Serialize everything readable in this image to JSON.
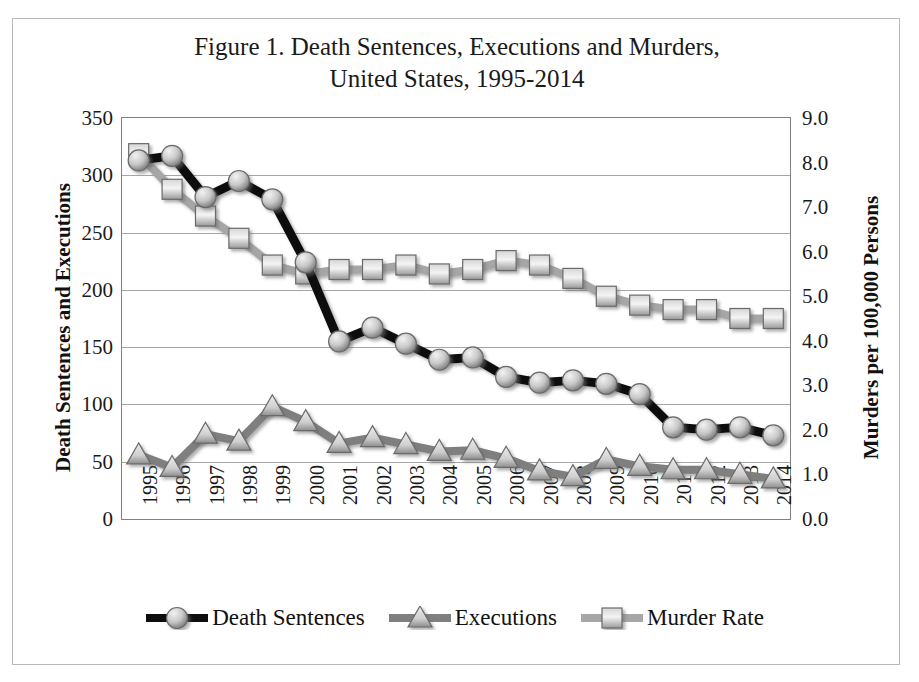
{
  "figure": {
    "title_line1": "Figure 1.  Death Sentences, Executions and Murders,",
    "title_line2": "United States, 1995-2014",
    "y_left_title": "Death Sentences and Executions",
    "y_right_title": "Murders per 100,000 Persons"
  },
  "legend": {
    "items": [
      {
        "label": "Death Sentences",
        "marker": "circle-marker",
        "color": "#0d0d0d"
      },
      {
        "label": "Executions",
        "marker": "triangle-marker",
        "color": "#7f7f7f"
      },
      {
        "label": "Murder Rate",
        "marker": "square-marker",
        "color": "#a6a6a6"
      }
    ]
  },
  "axes": {
    "left_ticks": [
      "0",
      "50",
      "100",
      "150",
      "200",
      "250",
      "300",
      "350"
    ],
    "right_ticks": [
      "0.0",
      "1.0",
      "2.0",
      "3.0",
      "4.0",
      "5.0",
      "6.0",
      "7.0",
      "8.0",
      "9.0"
    ],
    "x_ticks": [
      "1995",
      "1996",
      "1997",
      "1998",
      "1999",
      "2000",
      "2001",
      "2002",
      "2003",
      "2004",
      "2005",
      "2006",
      "2007",
      "2008",
      "2009",
      "2010",
      "2011",
      "2012",
      "2013",
      "2014"
    ]
  },
  "chart_data": {
    "type": "line",
    "title": "Figure 1.  Death Sentences, Executions and Murders, United States, 1995-2014",
    "xlabel": "",
    "ylabel": "Death Sentences and Executions",
    "y2label": "Murders per 100,000 Persons",
    "ylim": [
      0,
      350
    ],
    "y2lim": [
      0.0,
      9.0
    ],
    "grid": true,
    "legend_position": "bottom",
    "categories": [
      "1995",
      "1996",
      "1997",
      "1998",
      "1999",
      "2000",
      "2001",
      "2002",
      "2003",
      "2004",
      "2005",
      "2006",
      "2007",
      "2008",
      "2009",
      "2010",
      "2011",
      "2012",
      "2013",
      "2014"
    ],
    "series": [
      {
        "name": "Death Sentences",
        "axis": "left",
        "marker": "circle",
        "color": "#0d0d0d",
        "values": [
          313,
          317,
          281,
          295,
          279,
          224,
          155,
          167,
          153,
          139,
          141,
          124,
          119,
          121,
          118,
          109,
          80,
          78,
          80,
          73
        ]
      },
      {
        "name": "Executions",
        "axis": "left",
        "marker": "triangle",
        "color": "#7f7f7f",
        "values": [
          56,
          45,
          74,
          68,
          98,
          85,
          66,
          71,
          65,
          59,
          60,
          53,
          42,
          37,
          52,
          46,
          43,
          43,
          39,
          35
        ]
      },
      {
        "name": "Murder Rate",
        "axis": "right",
        "marker": "square",
        "color": "#a6a6a6",
        "values": [
          8.2,
          7.4,
          6.8,
          6.3,
          5.7,
          5.5,
          5.6,
          5.6,
          5.7,
          5.5,
          5.6,
          5.8,
          5.7,
          5.4,
          5.0,
          4.8,
          4.7,
          4.7,
          4.5,
          4.5
        ]
      }
    ]
  }
}
